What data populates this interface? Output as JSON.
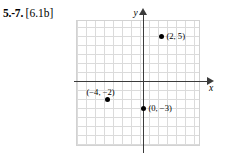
{
  "exercise": {
    "range_label": "5.-7.",
    "objective_label": "[6.1b]"
  },
  "chart_data": {
    "type": "scatter",
    "title": "",
    "xlabel": "x",
    "ylabel": "y",
    "grid": true,
    "grid_spacing": 1,
    "xlim": [
      -7,
      6
    ],
    "ylim": [
      -7,
      7
    ],
    "legend": "none",
    "points": [
      {
        "label": "(2, 5)",
        "x": 2,
        "y": 5,
        "label_position": "right"
      },
      {
        "label": "(-4, -2)",
        "x": -4,
        "y": -2,
        "label_position": "above"
      },
      {
        "label": "(0, -3)",
        "x": 0,
        "y": -3,
        "label_position": "right"
      }
    ],
    "point_labels": {
      "p1": "(2, 5)",
      "p2": "(−4, −2)",
      "p3": "(0, −3)"
    }
  },
  "colors": {
    "axis": "#3b3b3b",
    "grid": "#cfcfcf",
    "point": "#000000",
    "text": "#000000",
    "background": "#ffffff"
  }
}
